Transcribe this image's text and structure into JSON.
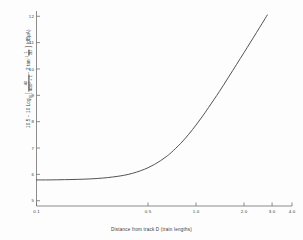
{
  "chart_data": {
    "type": "line",
    "title": "",
    "xlabel": "Distance from track D (train lengths)",
    "ylabel": "10.5 − 10 Log10[ 40/(40D² + 1) − 2 tan⁻¹ (1/2D) ]  (dBµA)",
    "xscale": "log",
    "yscale": "linear",
    "xlim": [
      0.1,
      4.0
    ],
    "ylim": [
      4.8,
      12.2
    ],
    "grid": false,
    "legend": "none",
    "xticks": [
      "0.1",
      "0.5",
      "1.0",
      "2.0",
      "3.0",
      "4.0"
    ],
    "xtick_values": [
      0.1,
      0.5,
      1.0,
      2.0,
      3.0,
      4.0
    ],
    "yticks": [
      "5",
      "6",
      "7",
      "8",
      "9",
      "10",
      "11",
      "12"
    ],
    "ytick_values": [
      5,
      6,
      7,
      8,
      9,
      10,
      11,
      12
    ],
    "series": [
      {
        "name": "field strength curve",
        "x": [
          0.1,
          0.12,
          0.15,
          0.18,
          0.22,
          0.26,
          0.3,
          0.35,
          0.4,
          0.45,
          0.5,
          0.55,
          0.6,
          0.65,
          0.7,
          0.8,
          0.9,
          1.0,
          1.1,
          1.2,
          1.4,
          1.6,
          1.8,
          2.0,
          2.2,
          2.4,
          2.6,
          2.8
        ],
        "y": [
          5.79,
          5.79,
          5.8,
          5.81,
          5.83,
          5.86,
          5.9,
          5.96,
          6.04,
          6.14,
          6.25,
          6.38,
          6.52,
          6.67,
          6.83,
          7.17,
          7.52,
          7.87,
          8.21,
          8.54,
          9.14,
          9.69,
          10.18,
          10.62,
          11.02,
          11.39,
          11.73,
          12.05
        ]
      }
    ]
  },
  "axis_labels": {
    "y_expression": {
      "prefix": "10.5 − 10 Log",
      "log_base": "10",
      "open_bracket": "[",
      "frac1_num": "40",
      "frac1_den": "40D² + 1",
      "minus": "− 2 tan",
      "tan_power": "−1",
      "frac2_num": "1",
      "frac2_den": "2D",
      "close_bracket": "]",
      "units": "(dBµA)"
    },
    "x_title": "Distance from track D (train lengths)"
  },
  "style": {
    "curve_color": "#4a4a4a",
    "axis_color": "#6e6e6e",
    "text_color": "#3a3a3a",
    "background": "#fdfdfd"
  }
}
